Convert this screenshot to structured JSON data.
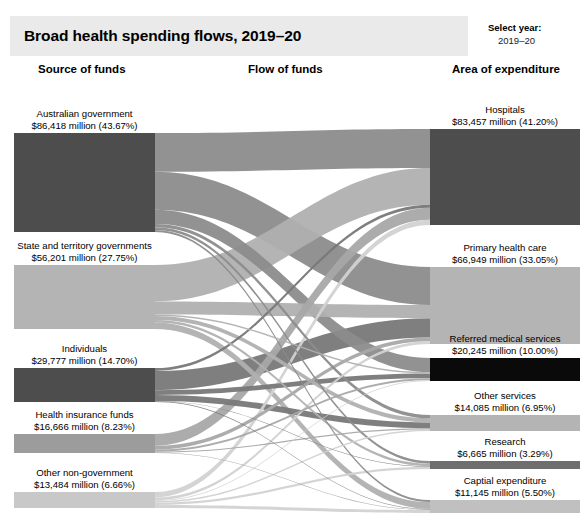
{
  "header": {
    "title": "Broad health spending flows, 2019–20",
    "select_year_label": "Select year:",
    "select_year_value": "2019–20",
    "banner_color": "#eaeaea"
  },
  "columns": {
    "source": "Source of funds",
    "flow": "Flow of funds",
    "area": "Area of expenditure"
  },
  "chart_data": {
    "type": "sankey",
    "title": "Broad health spending flows, 2019–20",
    "unit": "$ million",
    "total": 197846,
    "sources": [
      {
        "id": "aus_gov",
        "name": "Australian government",
        "value": 86418,
        "value_label": "$86,418 million (43.67%)",
        "percent": 43.67,
        "color": "#4d4d4d",
        "y": 133,
        "height": 99
      },
      {
        "id": "state_gov",
        "name": "State and territory governments",
        "value": 56201,
        "value_label": "$56,201 million (27.75%)",
        "percent": 27.75,
        "color": "#b4b4b4",
        "y": 265,
        "height": 64
      },
      {
        "id": "individuals",
        "name": "Individuals",
        "value": 29777,
        "value_label": "$29,777 million (14.70%)",
        "percent": 14.7,
        "color": "#4d4d4d",
        "y": 368,
        "height": 34
      },
      {
        "id": "health_ins",
        "name": "Health insurance funds",
        "value": 16666,
        "value_label": "$16,666 million (8.23%)",
        "percent": 8.23,
        "color": "#9c9c9c",
        "y": 434,
        "height": 19
      },
      {
        "id": "other_nongov",
        "name": "Other non-government",
        "value": 13484,
        "value_label": "$13,484 million (6.66%)",
        "percent": 6.66,
        "color": "#c8c8c8",
        "y": 492,
        "height": 16
      }
    ],
    "targets": [
      {
        "id": "hospitals",
        "name": "Hospitals",
        "value": 83457,
        "value_label": "$83,457 million (41.20%)",
        "percent": 41.2,
        "color": "#4d4d4d",
        "y": 129,
        "height": 96
      },
      {
        "id": "primary",
        "name": "Primary health care",
        "value": 66949,
        "value_label": "$66,949 million (33.05%)",
        "percent": 33.05,
        "color": "#b4b4b4",
        "y": 267,
        "height": 77
      },
      {
        "id": "referred",
        "name": "Referred medical services",
        "value": 20245,
        "value_label": "$20,245 million (10.00%)",
        "percent": 10.0,
        "color": "#0a0a0a",
        "y": 358,
        "height": 23
      },
      {
        "id": "other_services",
        "name": "Other services",
        "value": 14085,
        "value_label": "$14,085 million (6.95%)",
        "percent": 6.95,
        "color": "#b4b4b4",
        "y": 415,
        "height": 16
      },
      {
        "id": "research",
        "name": "Research",
        "value": 6665,
        "value_label": "$6,665 million (3.29%)",
        "percent": 3.29,
        "color": "#6e6e6e",
        "y": 461,
        "height": 8
      },
      {
        "id": "capital",
        "name": "Captial expenditure",
        "value": 11145,
        "value_label": "$11,145 million (5.50%)",
        "percent": 5.5,
        "color": "#c0c0c0",
        "y": 500,
        "height": 13
      }
    ],
    "links": [
      {
        "source": "aus_gov",
        "target": "hospitals",
        "value": 33900,
        "color": "#8c8c8c",
        "opacity": 0.95
      },
      {
        "source": "aus_gov",
        "target": "primary",
        "value": 33000,
        "color": "#8c8c8c",
        "opacity": 0.95
      },
      {
        "source": "aus_gov",
        "target": "referred",
        "value": 12500,
        "color": "#8c8c8c",
        "opacity": 0.95
      },
      {
        "source": "aus_gov",
        "target": "other_services",
        "value": 2900,
        "color": "#8c8c8c",
        "opacity": 0.95
      },
      {
        "source": "aus_gov",
        "target": "research",
        "value": 2300,
        "color": "#8c8c8c",
        "opacity": 0.95
      },
      {
        "source": "aus_gov",
        "target": "capital",
        "value": 1800,
        "color": "#8c8c8c",
        "opacity": 0.95
      },
      {
        "source": "state_gov",
        "target": "hospitals",
        "value": 32000,
        "color": "#b0b0b0",
        "opacity": 0.95
      },
      {
        "source": "state_gov",
        "target": "primary",
        "value": 11500,
        "color": "#b0b0b0",
        "opacity": 0.95
      },
      {
        "source": "state_gov",
        "target": "referred",
        "value": 1200,
        "color": "#b0b0b0",
        "opacity": 0.95
      },
      {
        "source": "state_gov",
        "target": "other_services",
        "value": 3600,
        "color": "#b0b0b0",
        "opacity": 0.95
      },
      {
        "source": "state_gov",
        "target": "research",
        "value": 2100,
        "color": "#b0b0b0",
        "opacity": 0.95
      },
      {
        "source": "state_gov",
        "target": "capital",
        "value": 5800,
        "color": "#b0b0b0",
        "opacity": 0.95
      },
      {
        "source": "individuals",
        "target": "hospitals",
        "value": 2600,
        "color": "#787878",
        "opacity": 0.95
      },
      {
        "source": "individuals",
        "target": "primary",
        "value": 16800,
        "color": "#787878",
        "opacity": 0.95
      },
      {
        "source": "individuals",
        "target": "referred",
        "value": 4200,
        "color": "#787878",
        "opacity": 0.95
      },
      {
        "source": "individuals",
        "target": "other_services",
        "value": 5200,
        "color": "#787878",
        "opacity": 0.95
      },
      {
        "source": "individuals",
        "target": "research",
        "value": 400,
        "color": "#787878",
        "opacity": 0.95
      },
      {
        "source": "individuals",
        "target": "capital",
        "value": 577,
        "color": "#787878",
        "opacity": 0.95
      },
      {
        "source": "health_ins",
        "target": "hospitals",
        "value": 10400,
        "color": "#a8a8a8",
        "opacity": 0.95
      },
      {
        "source": "health_ins",
        "target": "primary",
        "value": 3300,
        "color": "#a8a8a8",
        "opacity": 0.95
      },
      {
        "source": "health_ins",
        "target": "referred",
        "value": 1600,
        "color": "#a8a8a8",
        "opacity": 0.95
      },
      {
        "source": "health_ins",
        "target": "other_services",
        "value": 1000,
        "color": "#a8a8a8",
        "opacity": 0.95
      },
      {
        "source": "health_ins",
        "target": "capital",
        "value": 366,
        "color": "#a8a8a8",
        "opacity": 0.95
      },
      {
        "source": "other_nongov",
        "target": "hospitals",
        "value": 4557,
        "color": "#d2d2d2",
        "opacity": 0.95
      },
      {
        "source": "other_nongov",
        "target": "primary",
        "value": 2349,
        "color": "#d2d2d2",
        "opacity": 0.95
      },
      {
        "source": "other_nongov",
        "target": "referred",
        "value": 745,
        "color": "#d2d2d2",
        "opacity": 0.95
      },
      {
        "source": "other_nongov",
        "target": "other_services",
        "value": 1385,
        "color": "#d2d2d2",
        "opacity": 0.95
      },
      {
        "source": "other_nongov",
        "target": "research",
        "value": 1865,
        "color": "#d2d2d2",
        "opacity": 0.95
      },
      {
        "source": "other_nongov",
        "target": "capital",
        "value": 2583,
        "color": "#d2d2d2",
        "opacity": 0.95
      }
    ],
    "layout": {
      "left_node_x": 14,
      "left_node_w": 141,
      "right_node_x": 430,
      "right_node_w": 150,
      "flow_left_x": 155,
      "flow_right_x": 430
    }
  }
}
